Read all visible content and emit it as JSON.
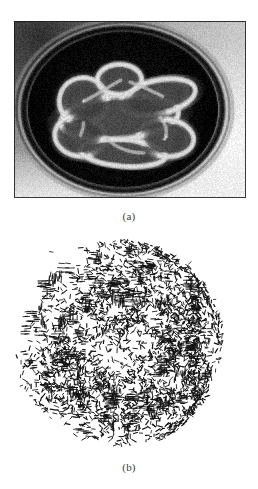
{
  "figure": {
    "background_color": "#ffffff",
    "ink_color": "#000000",
    "panels": [
      {
        "id": "a",
        "caption": "(a)",
        "kind": "grayscale-photograph",
        "description": "Grayscale medical scan showing a dark circular ring structure with bright rim-enhancing lobed lesions at the centre",
        "x": 14,
        "y": 21,
        "width": 232,
        "height": 177,
        "tones": {
          "outer_background": "#b4b4b4",
          "ring_dark": "#0d0d0d",
          "ring_highlight": "#dcdcdc",
          "interior_dark": "#060606",
          "lesion_bright": "#cfcfcf",
          "lesion_core": "#585858",
          "bottom_light": "#e2e2e2"
        }
      },
      {
        "id": "b",
        "caption": "(b)",
        "kind": "orientation-stroke-field",
        "description": "Edge orientation map of panel (a): dense field of short black line segments tracing the ring boundary and lesion contours, with blank interior holes",
        "x": 13,
        "y": 233,
        "width": 232,
        "height": 220,
        "stroke_color": "#111111",
        "stroke_length_px": 4.2,
        "stroke_width_px": 0.85,
        "stroke_count": 2600
      }
    ]
  },
  "chart_data": {
    "type": "scatter",
    "title": "",
    "xlabel": "",
    "ylabel": ""
  }
}
